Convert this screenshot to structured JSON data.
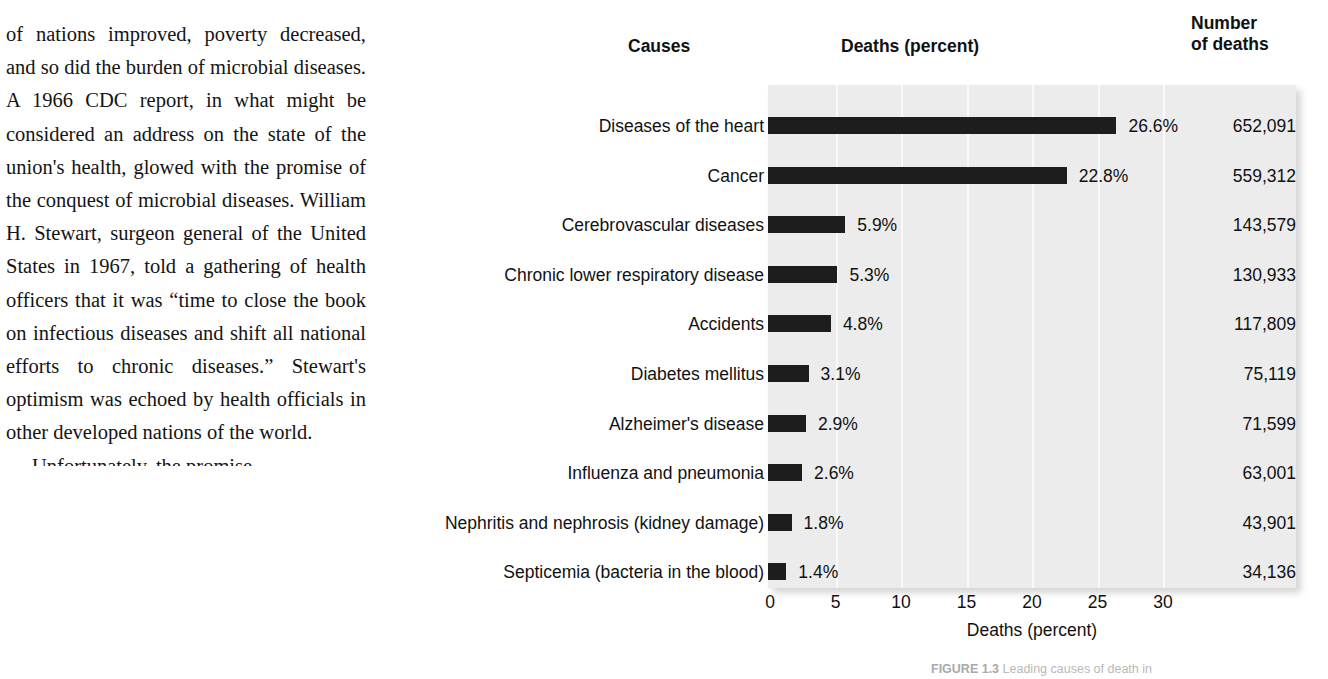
{
  "page": {
    "background_color": "#ffffff",
    "text_color": "#141414"
  },
  "body_text": {
    "paragraphs": [
      "of nations improved, poverty decreased, and so did the burden of microbial diseases. A 1966 CDC report, in what might be considered an address on the state of the union's health, glowed with the promise of the conquest of microbial diseases. William H. Stewart, surgeon general of the United States in 1967, told a gathering of health officers that it was “time to close the book on infectious diseases and shift all national efforts to chronic diseases.” Stewart's optimism was echoed by health officials in other developed nations of the world.",
      "Unfortunately, the promise"
    ]
  },
  "figure": {
    "headers": {
      "causes": "Causes",
      "deaths_percent": "Deaths (percent)",
      "number_of_deaths": "Number\nof deaths"
    },
    "caption_prefix": "FIGURE 1.3",
    "caption_text": "Leading causes of death in"
  },
  "chart_data": {
    "type": "bar",
    "orientation": "horizontal",
    "title": "Deaths (percent)",
    "xlabel": "Deaths (percent)",
    "ylabel": "Causes",
    "xlim": [
      0,
      32
    ],
    "xticks": [
      0,
      5,
      10,
      15,
      20,
      25,
      30
    ],
    "xtick_labels": [
      "0",
      "5",
      "10",
      "15",
      "20",
      "25",
      "30"
    ],
    "grid": true,
    "grid_axis": "x",
    "legend": "none",
    "bar_color": "#1d1d1d",
    "panel_color": "#ececec",
    "categories": [
      "Diseases of the heart",
      "Cancer",
      "Cerebrovascular diseases",
      "Chronic lower respiratory disease",
      "Accidents",
      "Diabetes mellitus",
      "Alzheimer's disease",
      "Influenza and pneumonia",
      "Nephritis and nephrosis (kidney damage)",
      "Septicemia (bacteria in the blood)"
    ],
    "values": [
      26.6,
      22.8,
      5.9,
      5.3,
      4.8,
      3.1,
      2.9,
      2.6,
      1.8,
      1.4
    ],
    "value_labels": [
      "26.6%",
      "22.8%",
      "5.9%",
      "5.3%",
      "4.8%",
      "3.1%",
      "2.9%",
      "2.6%",
      "1.8%",
      "1.4%"
    ],
    "secondary_column": {
      "header": "Number of deaths",
      "values": [
        "652,091",
        "559,312",
        "143,579",
        "130,933",
        "117,809",
        "75,119",
        "71,599",
        "63,001",
        "43,901",
        "34,136"
      ]
    }
  }
}
